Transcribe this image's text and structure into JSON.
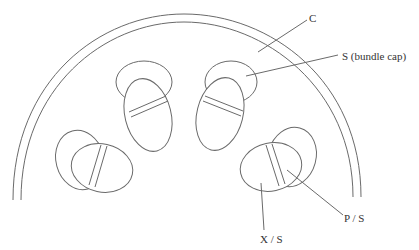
{
  "diagram": {
    "type": "cross-section-schematic",
    "labels": {
      "cortex": "C",
      "bundle_cap": "S (bundle cap)",
      "phloem": "P / S",
      "xylem": "X / S"
    },
    "colors": {
      "line": "#6a6a6a",
      "text": "#333333",
      "background": "#ffffff"
    }
  }
}
